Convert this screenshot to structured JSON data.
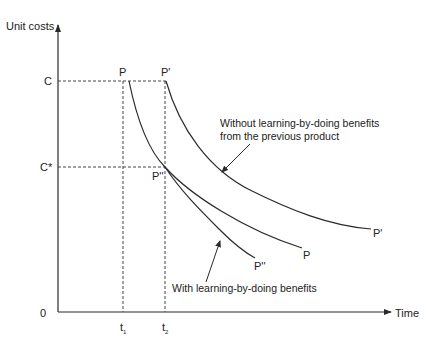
{
  "diagram": {
    "y_axis_label": "Unit costs",
    "x_axis_label": "Time",
    "origin_label": "0",
    "y_ticks": [
      {
        "label": "C",
        "y": 81
      },
      {
        "label": "C*",
        "y": 167
      }
    ],
    "x_ticks": [
      {
        "label": "t",
        "sub": "1",
        "x": 123
      },
      {
        "label": "t",
        "sub": "2",
        "x": 165
      }
    ],
    "curves": [
      {
        "name": "P",
        "start_label": "P",
        "end_label": "P"
      },
      {
        "name": "P'",
        "start_label": "P'",
        "end_label": "P'"
      },
      {
        "name": "P''",
        "mid_label": "P''",
        "end_label": "P''"
      }
    ],
    "annotations": {
      "without_line1": "Without learning-by-doing benefits",
      "without_line2": "from the previous product",
      "with": "With learning-by-doing benefits"
    },
    "colors": {
      "ink": "#2a2a2a",
      "background": "#ffffff"
    }
  }
}
